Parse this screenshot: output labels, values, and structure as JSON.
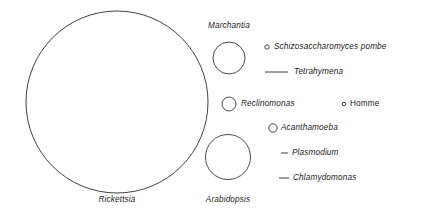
{
  "figure": {
    "type": "proportional-circle-diagram",
    "stroke_color": "#2b2b2b",
    "background_color": "#ffffff",
    "text_color": "#1a1a1a"
  },
  "circles": [
    {
      "id": "rickettsia",
      "label": "Rickettsia",
      "italic": true,
      "cx": 117,
      "cy": 102,
      "r": 91,
      "label_x": 117,
      "label_y": 203,
      "label_align": "center",
      "marker": "circle"
    },
    {
      "id": "marchantia",
      "label": "Marchantia",
      "italic": true,
      "cx": 229,
      "cy": 58,
      "r": 16,
      "label_x": 229,
      "label_y": 29,
      "label_align": "center",
      "marker": "circle"
    },
    {
      "id": "arabidopsis",
      "label": "Arabidopsis",
      "italic": true,
      "cx": 228,
      "cy": 157,
      "r": 22.5,
      "label_x": 228,
      "label_y": 203,
      "label_align": "center",
      "marker": "circle"
    },
    {
      "id": "reclinomonas",
      "label": "Reclinomonas",
      "italic": true,
      "cx": 229,
      "cy": 104,
      "r": 7,
      "label_x": 241,
      "label_y": 101,
      "label_align": "left",
      "marker": "circle"
    },
    {
      "id": "acanthamoeba",
      "label": "Acanthamoeba",
      "italic": true,
      "cx": 273,
      "cy": 128,
      "r": 4.2,
      "label_x": 281,
      "label_y": 125,
      "label_align": "left",
      "marker": "circle"
    },
    {
      "id": "schizosaccharomyces-pombe",
      "label": "Schizosaccharomyces pombe",
      "italic": true,
      "cx": 267,
      "cy": 47,
      "r": 2.2,
      "label_x": 274,
      "label_y": 44,
      "label_align": "left",
      "marker": "circle"
    },
    {
      "id": "homme",
      "label": "Homme",
      "italic": false,
      "cx": 344,
      "cy": 104,
      "r": 1.7,
      "label_x": 350,
      "label_y": 101,
      "label_align": "left",
      "marker": "circle"
    }
  ],
  "dashes": [
    {
      "id": "tetrahymena",
      "label": "Tetrahymena",
      "italic": true,
      "x1": 265,
      "x2": 288,
      "y": 72,
      "label_x": 294,
      "label_y": 69,
      "marker": "line"
    },
    {
      "id": "plasmodium",
      "label": "Plasmodium",
      "italic": true,
      "x1": 281,
      "x2": 288,
      "y": 153,
      "label_x": 291,
      "label_y": 150,
      "marker": "line"
    },
    {
      "id": "chlamydomonas",
      "label": "Chlamydomonas",
      "italic": true,
      "x1": 279,
      "x2": 289,
      "y": 178,
      "label_x": 292,
      "label_y": 175,
      "marker": "line"
    }
  ],
  "labels": {
    "rickettsia": "Rickettsia",
    "marchantia": "Marchantia",
    "arabidopsis": "Arabidopsis",
    "reclinomonas": "Reclinomonas",
    "acanthamoeba": "Acanthamoeba",
    "schizosaccharomyces_pombe": "Schizosaccharomyces pombe",
    "homme": "Homme",
    "tetrahymena": "Tetrahymena",
    "plasmodium": "Plasmodium",
    "chlamydomonas": "Chlamydomonas"
  }
}
